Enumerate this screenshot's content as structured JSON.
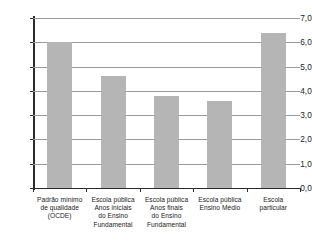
{
  "chart_data": {
    "type": "bar",
    "title": "",
    "subtitle": "",
    "xlabel": "",
    "ylabel": "",
    "ylim": [
      0.0,
      7.0
    ],
    "ytick_step": 1.0,
    "grid": true,
    "legend": "none",
    "decimal_separator": ",",
    "bar_color": "#b5b5b5",
    "axis_color": "#2b2b2b",
    "gridline_color": "#9a9a9a",
    "categories": [
      "Padrão mínimo de qualidade (OCDE)",
      "Escola pública Anos iniciais do Ensino Fundamental",
      "Escola pública Anos finais do Ensino Fundamental",
      "Escola pública Ensino Médio",
      "Escola particular"
    ],
    "category_label_lines": [
      [
        "Padrão mínimo",
        "de qualidade",
        "(OCDE)"
      ],
      [
        "Escola pública",
        "Anos iniciais",
        "do Ensino",
        "Fundamental"
      ],
      [
        "Escola pública",
        "Anos finais",
        "do Ensino",
        "Fundamental"
      ],
      [
        "Escola pública",
        "Ensino Médio"
      ],
      [
        "Escola",
        "particular"
      ]
    ],
    "values": [
      6.0,
      4.6,
      3.8,
      3.6,
      6.4
    ],
    "ytick_labels": [
      "0,0",
      "1,0",
      "2,0",
      "3,0",
      "4,0",
      "5,0",
      "6,0",
      "7,0"
    ],
    "ytick_values": [
      0.0,
      1.0,
      2.0,
      3.0,
      4.0,
      5.0,
      6.0,
      7.0
    ]
  }
}
